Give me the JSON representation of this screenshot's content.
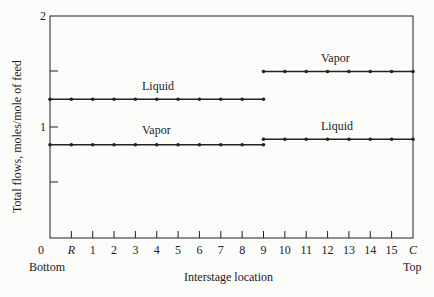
{
  "chart_data": {
    "type": "line",
    "title": "",
    "xlabel": "Interstage location",
    "ylabel": "Total flows, moles/mole of feed",
    "x_end_labels": {
      "left": "Bottom",
      "right": "Top"
    },
    "x_tick_labels": [
      "0",
      "R",
      "1",
      "2",
      "3",
      "4",
      "5",
      "6",
      "7",
      "8",
      "9",
      "10",
      "11",
      "12",
      "13",
      "14",
      "15",
      "C"
    ],
    "y_tick_labels": [
      "1",
      "2"
    ],
    "ylim": [
      0,
      2
    ],
    "grid": false,
    "series": [
      {
        "name": "Liquid",
        "section": "below feed",
        "x_range": [
          "0",
          "9.5"
        ],
        "values": [
          1.25,
          1.25,
          1.25,
          1.25,
          1.25,
          1.25,
          1.25,
          1.25,
          1.25,
          1.25,
          1.25
        ]
      },
      {
        "name": "Vapor",
        "section": "below feed",
        "x_range": [
          "0",
          "9.5"
        ],
        "values": [
          0.84,
          0.84,
          0.84,
          0.84,
          0.84,
          0.84,
          0.84,
          0.84,
          0.84,
          0.84,
          0.84
        ]
      },
      {
        "name": "Vapor",
        "section": "above feed",
        "x_range": [
          "9.5",
          "Top"
        ],
        "values": [
          1.5,
          1.5,
          1.5,
          1.5,
          1.5,
          1.5,
          1.5,
          1.5
        ]
      },
      {
        "name": "Liquid",
        "section": "above feed",
        "x_range": [
          "9.5",
          "Top"
        ],
        "values": [
          0.89,
          0.89,
          0.89,
          0.89,
          0.89,
          0.89,
          0.89,
          0.89
        ]
      }
    ],
    "annotations": [
      "Liquid",
      "Vapor",
      "Vapor",
      "Liquid"
    ]
  }
}
